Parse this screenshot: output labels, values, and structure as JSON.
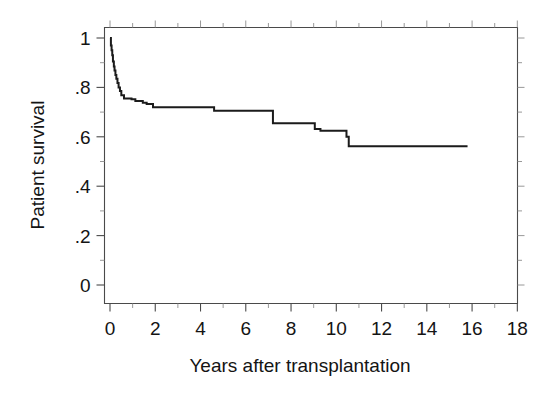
{
  "chart_data": {
    "type": "line",
    "subtype": "kaplan-meier-step",
    "title": "",
    "xlabel": "Years after transplantation",
    "ylabel": "Patient survival",
    "xlim": [
      -0.55,
      18.9
    ],
    "ylim": [
      -0.02,
      1.06
    ],
    "grid": false,
    "legend": null,
    "x_ticks": [
      0,
      2,
      4,
      6,
      8,
      10,
      12,
      14,
      16,
      18
    ],
    "x_tick_labels": [
      "0",
      "2",
      "4",
      "6",
      "8",
      "10",
      "12",
      "14",
      "16",
      "18"
    ],
    "x_minor_ticks": [
      1,
      3,
      5,
      7,
      9,
      11,
      13,
      15,
      17
    ],
    "y_ticks": [
      0,
      0.2,
      0.4,
      0.6,
      0.8,
      1.0
    ],
    "y_tick_labels": [
      "0",
      ".2",
      ".4",
      ".6",
      ".8",
      "1"
    ],
    "y_minor_ticks": [
      0.1,
      0.3,
      0.5,
      0.7,
      0.9
    ],
    "series": [
      {
        "name": "Patient survival",
        "color": "#1b1b1b",
        "x": [
          0.0,
          0.04,
          0.07,
          0.1,
          0.13,
          0.17,
          0.2,
          0.24,
          0.28,
          0.33,
          0.38,
          0.44,
          0.5,
          0.62,
          0.95,
          1.12,
          1.45,
          1.62,
          1.9,
          4.6,
          7.2,
          9.05,
          9.3,
          10.45,
          10.55,
          15.8
        ],
        "y": [
          1.0,
          0.97,
          0.95,
          0.93,
          0.905,
          0.885,
          0.868,
          0.85,
          0.835,
          0.818,
          0.8,
          0.785,
          0.768,
          0.755,
          0.752,
          0.745,
          0.738,
          0.733,
          0.72,
          0.705,
          0.655,
          0.632,
          0.625,
          0.6,
          0.562,
          0.562
        ]
      }
    ],
    "annotations": []
  },
  "axes": {
    "y_title": "Patient survival",
    "x_title": "Years after transplantation",
    "x_tick_labels": [
      "0",
      "2",
      "4",
      "6",
      "8",
      "10",
      "12",
      "14",
      "16",
      "18"
    ],
    "y_tick_labels": [
      "1",
      ".8",
      ".6",
      ".4",
      ".2",
      "0"
    ]
  }
}
